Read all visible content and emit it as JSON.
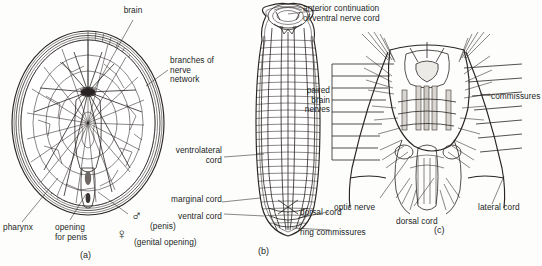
{
  "figure": {
    "background": "#fdfdfc",
    "ink": "#231f1e"
  },
  "panels": [
    {
      "id": "a",
      "caption": "(a)",
      "description": "Dorsal view of anterior end showing brain and polygonal nerve network"
    },
    {
      "id": "b",
      "caption": "(b)",
      "description": "Whole body showing longitudinal nerve cords and ring commissures"
    },
    {
      "id": "c",
      "caption": "(c)",
      "description": "Detail of brain region with commissures and nerve roots"
    }
  ],
  "labels": {
    "panel_a": [
      {
        "name": "brain",
        "text": "brain"
      },
      {
        "name": "branches-of-nerve-network",
        "text": "branches of\nnerve\nnetwork"
      },
      {
        "name": "pharynx",
        "text": "pharynx"
      },
      {
        "name": "opening-for-penis",
        "text": "opening\nfor penis"
      },
      {
        "name": "penis",
        "text": "(penis)"
      },
      {
        "name": "genital-opening",
        "text": "(genital opening)"
      }
    ],
    "panel_b": [
      {
        "name": "anterior-continuation",
        "text": "anterior continuation\nof ventral nerve cord"
      },
      {
        "name": "paired-brain-nerves",
        "text": "paired\nbrain\nnerves"
      },
      {
        "name": "ventrolateral-cord",
        "text": "ventrolateral\ncord"
      },
      {
        "name": "marginal-cord",
        "text": "marginal cord"
      },
      {
        "name": "ventral-cord",
        "text": "ventral cord"
      },
      {
        "name": "dorsal-cord",
        "text": "dorsal cord"
      },
      {
        "name": "ring-commissures",
        "text": "ring commissures"
      }
    ],
    "panel_c": [
      {
        "name": "commissures",
        "text": "commissures"
      },
      {
        "name": "optic-nerve",
        "text": "optic nerve"
      },
      {
        "name": "dorsal-cord",
        "text": "dorsal cord"
      },
      {
        "name": "lateral-cord",
        "text": "lateral cord"
      }
    ]
  },
  "symbols": {
    "male": "♂",
    "female": "♀"
  }
}
